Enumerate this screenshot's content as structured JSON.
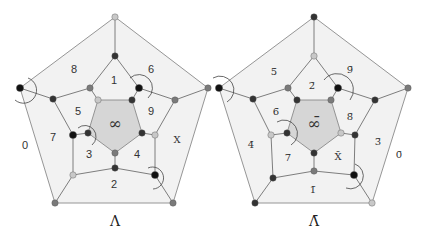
{
  "diagrams": [
    {
      "id": "lambda",
      "title": "Λ",
      "center_label": "∞",
      "face_labels": [
        {
          "text": "8",
          "face": "upper-left-outer"
        },
        {
          "text": "6",
          "face": "upper-right-outer"
        },
        {
          "text": "1",
          "face": "top-inner"
        },
        {
          "text": "5",
          "face": "left-inner"
        },
        {
          "text": "9",
          "face": "right-inner"
        },
        {
          "text": "X",
          "face": "right-outer"
        },
        {
          "text": "0",
          "face": "left-outer"
        },
        {
          "text": "7",
          "face": "lower-left-inner"
        },
        {
          "text": "3",
          "face": "bottom-left-inner"
        },
        {
          "text": "4",
          "face": "bottom-right-inner"
        },
        {
          "text": "2",
          "face": "bottom-outer"
        }
      ],
      "node_colors": {
        "outer": [
          "light",
          "mid",
          "mid",
          "mid",
          "black"
        ],
        "middle": [
          "dark",
          "black",
          "mid",
          "light",
          "black",
          "dark",
          "light",
          "black",
          "dark",
          "mid"
        ],
        "inner": [
          "light",
          "dark",
          "dark",
          "mid",
          "dark"
        ]
      }
    },
    {
      "id": "lambda-bar",
      "title": "Λ̄",
      "center_label": "∞̄",
      "face_labels": [
        {
          "text": "5̄",
          "face": "upper-left-outer"
        },
        {
          "text": "9̄",
          "face": "upper-right-outer"
        },
        {
          "text": "2̄",
          "face": "top-inner"
        },
        {
          "text": "6̄",
          "face": "left-inner"
        },
        {
          "text": "8̄",
          "face": "right-inner"
        },
        {
          "text": "3̄",
          "face": "right-outer"
        },
        {
          "text": "0̄",
          "face": "far-right"
        },
        {
          "text": "4̄",
          "face": "left-outer"
        },
        {
          "text": "7̄",
          "face": "bottom-left-inner"
        },
        {
          "text": "X̄",
          "face": "bottom-right-inner"
        },
        {
          "text": "1̄",
          "face": "bottom-outer"
        }
      ],
      "node_colors": {
        "outer": [
          "dark",
          "mid",
          "light",
          "dark",
          "black"
        ],
        "middle": [
          "light",
          "black",
          "dark",
          "dark",
          "black",
          "mid",
          "dark",
          "light",
          "dark",
          "mid"
        ],
        "inner": [
          "dark",
          "mid",
          "light",
          "dark",
          "dark"
        ]
      }
    }
  ],
  "colors": {
    "black": "#111111",
    "dark": "#333333",
    "mid": "#7a7a7a",
    "light": "#c8c8c8",
    "outer_fill": "#f2f2f2",
    "inner_fill": "#d6d6d6"
  }
}
